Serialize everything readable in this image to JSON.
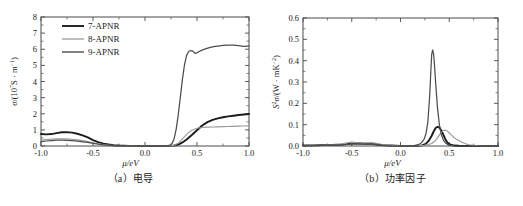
{
  "figure": {
    "panels": [
      {
        "id": "a",
        "caption": "（a）电导",
        "xlabel": "μ/eV",
        "ylabel_html": "σ/(10⁷S · m⁻¹)"
      },
      {
        "id": "b",
        "caption": "（b）功率因子",
        "xlabel": "μ/eV",
        "ylabel_html": "S²σ/(W · mK⁻²)"
      }
    ]
  },
  "colors": {
    "series_7APNR": "#1c1c1c",
    "series_8APNR": "#9a9a9a",
    "series_9APNR": "#4d4d4d",
    "axis": "#4a4a4a",
    "text": "#1a1a1a"
  },
  "legend": {
    "position": "top-left",
    "entries": [
      {
        "label": "7-APNR",
        "color": "#1c1c1c",
        "width": 1.9
      },
      {
        "label": "8-APNR",
        "color": "#9a9a9a",
        "width": 1.3
      },
      {
        "label": "9-APNR",
        "color": "#4d4d4d",
        "width": 1.4
      }
    ]
  },
  "chart_data": [
    {
      "type": "line",
      "panel": "a",
      "title": "（a）电导",
      "xlabel": "μ/eV",
      "ylabel": "σ/(10⁷S · m⁻¹)",
      "xlim": [
        -1.0,
        1.0
      ],
      "ylim": [
        0,
        8
      ],
      "xticks": [
        -1.0,
        -0.5,
        0.0,
        0.5,
        1.0
      ],
      "xticklabels": [
        "-1.0",
        "-0.5",
        "0.0",
        "0.5",
        "1.0"
      ],
      "yticks": [
        0,
        1,
        2,
        3,
        4,
        5,
        6,
        7,
        8
      ],
      "yticklabels": [
        "0",
        "1",
        "2",
        "3",
        "4",
        "5",
        "6",
        "7",
        "8"
      ],
      "grid": false,
      "legend_position": "upper left",
      "series": [
        {
          "name": "7-APNR",
          "color": "#1c1c1c",
          "x": [
            -1.0,
            -0.95,
            -0.9,
            -0.85,
            -0.8,
            -0.75,
            -0.7,
            -0.65,
            -0.6,
            -0.55,
            -0.5,
            -0.45,
            -0.4,
            -0.35,
            -0.3,
            -0.25,
            -0.2,
            -0.15,
            -0.1,
            -0.05,
            0.0,
            0.05,
            0.1,
            0.15,
            0.2,
            0.25,
            0.28,
            0.3,
            0.33,
            0.36,
            0.4,
            0.45,
            0.5,
            0.55,
            0.6,
            0.65,
            0.7,
            0.75,
            0.8,
            0.85,
            0.9,
            0.95,
            1.0
          ],
          "y": [
            0.74,
            0.72,
            0.74,
            0.8,
            0.85,
            0.86,
            0.83,
            0.76,
            0.66,
            0.53,
            0.37,
            0.24,
            0.15,
            0.09,
            0.05,
            0.03,
            0.02,
            0.01,
            0.01,
            0.0,
            0.0,
            0.0,
            0.0,
            0.0,
            0.0,
            0.01,
            0.03,
            0.06,
            0.12,
            0.22,
            0.4,
            0.68,
            0.98,
            1.27,
            1.48,
            1.62,
            1.71,
            1.78,
            1.84,
            1.88,
            1.92,
            1.95,
            1.98
          ]
        },
        {
          "name": "8-APNR",
          "color": "#9a9a9a",
          "x": [
            -1.0,
            -0.95,
            -0.9,
            -0.85,
            -0.8,
            -0.75,
            -0.7,
            -0.65,
            -0.6,
            -0.55,
            -0.5,
            -0.45,
            -0.4,
            -0.35,
            -0.3,
            -0.25,
            -0.2,
            -0.15,
            -0.1,
            -0.05,
            0.0,
            0.05,
            0.1,
            0.15,
            0.2,
            0.25,
            0.28,
            0.3,
            0.33,
            0.36,
            0.4,
            0.45,
            0.5,
            0.55,
            0.6,
            0.65,
            0.7,
            0.75,
            0.8,
            0.85,
            0.9,
            0.95,
            1.0
          ],
          "y": [
            0.36,
            0.4,
            0.43,
            0.45,
            0.45,
            0.44,
            0.42,
            0.38,
            0.33,
            0.27,
            0.2,
            0.14,
            0.09,
            0.06,
            0.04,
            0.02,
            0.01,
            0.01,
            0.0,
            0.0,
            0.0,
            0.0,
            0.0,
            0.0,
            0.0,
            0.01,
            0.04,
            0.1,
            0.24,
            0.44,
            0.72,
            0.98,
            1.1,
            1.15,
            1.17,
            1.18,
            1.19,
            1.2,
            1.21,
            1.22,
            1.23,
            1.24,
            1.25
          ]
        },
        {
          "name": "9-APNR",
          "color": "#4d4d4d",
          "x": [
            -1.0,
            -0.95,
            -0.9,
            -0.85,
            -0.8,
            -0.75,
            -0.7,
            -0.65,
            -0.6,
            -0.55,
            -0.5,
            -0.45,
            -0.4,
            -0.35,
            -0.3,
            -0.25,
            -0.2,
            -0.15,
            -0.1,
            -0.05,
            0.0,
            0.05,
            0.1,
            0.15,
            0.2,
            0.24,
            0.26,
            0.28,
            0.3,
            0.32,
            0.34,
            0.36,
            0.38,
            0.4,
            0.42,
            0.44,
            0.46,
            0.48,
            0.5,
            0.52,
            0.55,
            0.58,
            0.62,
            0.66,
            0.7,
            0.75,
            0.8,
            0.85,
            0.9,
            0.95,
            1.0
          ],
          "y": [
            0.27,
            0.31,
            0.34,
            0.36,
            0.36,
            0.35,
            0.33,
            0.3,
            0.26,
            0.22,
            0.16,
            0.11,
            0.07,
            0.05,
            0.03,
            0.02,
            0.01,
            0.01,
            0.0,
            0.0,
            0.0,
            0.0,
            0.0,
            0.0,
            0.01,
            0.05,
            0.15,
            0.45,
            1.05,
            1.95,
            3.05,
            4.15,
            5.05,
            5.62,
            5.86,
            5.92,
            5.88,
            5.74,
            5.78,
            5.86,
            5.95,
            6.02,
            6.1,
            6.16,
            6.2,
            6.24,
            6.26,
            6.25,
            6.22,
            6.18,
            6.2
          ]
        }
      ]
    },
    {
      "type": "line",
      "panel": "b",
      "title": "（b）功率因子",
      "xlabel": "μ/eV",
      "ylabel": "S²σ/(W · mK⁻²)",
      "xlim": [
        -1.0,
        1.0
      ],
      "ylim": [
        0,
        0.6
      ],
      "xticks": [
        -1.0,
        -0.5,
        0.0,
        0.5,
        1.0
      ],
      "xticklabels": [
        "-1.0",
        "-0.5",
        "0.0",
        "0.5",
        "1.0"
      ],
      "yticks": [
        0.0,
        0.1,
        0.2,
        0.3,
        0.4,
        0.5,
        0.6
      ],
      "yticklabels": [
        "0.0",
        "0.1",
        "0.2",
        "0.3",
        "0.4",
        "0.5",
        "0.6"
      ],
      "grid": false,
      "legend_position": "none",
      "series": [
        {
          "name": "7-APNR",
          "color": "#1c1c1c",
          "x": [
            -1.0,
            -0.9,
            -0.8,
            -0.7,
            -0.6,
            -0.55,
            -0.5,
            -0.45,
            -0.4,
            -0.35,
            -0.3,
            -0.25,
            -0.2,
            -0.15,
            -0.1,
            0.0,
            0.1,
            0.18,
            0.22,
            0.26,
            0.29,
            0.32,
            0.34,
            0.36,
            0.38,
            0.4,
            0.42,
            0.44,
            0.46,
            0.48,
            0.5,
            0.55,
            0.6,
            0.7,
            0.8,
            0.9,
            1.0
          ],
          "y": [
            0.002,
            0.003,
            0.004,
            0.005,
            0.007,
            0.009,
            0.012,
            0.013,
            0.012,
            0.011,
            0.01,
            0.008,
            0.005,
            0.003,
            0.002,
            0.0,
            0.0,
            0.001,
            0.003,
            0.01,
            0.025,
            0.048,
            0.068,
            0.084,
            0.09,
            0.086,
            0.072,
            0.052,
            0.032,
            0.017,
            0.008,
            0.002,
            0.001,
            0.0,
            0.0,
            0.0,
            0.0
          ]
        },
        {
          "name": "8-APNR",
          "color": "#9a9a9a",
          "x": [
            -1.0,
            -0.9,
            -0.8,
            -0.7,
            -0.62,
            -0.56,
            -0.5,
            -0.45,
            -0.4,
            -0.35,
            -0.3,
            -0.25,
            -0.2,
            -0.15,
            -0.1,
            0.0,
            0.1,
            0.18,
            0.24,
            0.28,
            0.32,
            0.36,
            0.38,
            0.4,
            0.42,
            0.44,
            0.46,
            0.48,
            0.5,
            0.52,
            0.55,
            0.58,
            0.62,
            0.66,
            0.7,
            0.8,
            0.9,
            1.0
          ],
          "y": [
            0.001,
            0.002,
            0.003,
            0.005,
            0.008,
            0.014,
            0.018,
            0.016,
            0.013,
            0.014,
            0.016,
            0.013,
            0.008,
            0.004,
            0.002,
            0.0,
            0.0,
            0.001,
            0.003,
            0.006,
            0.012,
            0.026,
            0.038,
            0.052,
            0.065,
            0.073,
            0.074,
            0.07,
            0.062,
            0.052,
            0.04,
            0.03,
            0.02,
            0.012,
            0.006,
            0.001,
            0.0,
            0.0
          ]
        },
        {
          "name": "9-APNR",
          "color": "#4d4d4d",
          "x": [
            -1.0,
            -0.9,
            -0.8,
            -0.7,
            -0.6,
            -0.55,
            -0.5,
            -0.45,
            -0.4,
            -0.35,
            -0.3,
            -0.25,
            -0.2,
            -0.15,
            -0.1,
            0.0,
            0.08,
            0.14,
            0.18,
            0.21,
            0.24,
            0.26,
            0.28,
            0.3,
            0.31,
            0.32,
            0.33,
            0.34,
            0.35,
            0.36,
            0.38,
            0.4,
            0.42,
            0.44,
            0.46,
            0.48,
            0.5,
            0.55,
            0.6,
            0.7,
            0.8,
            0.9,
            1.0
          ],
          "y": [
            0.001,
            0.002,
            0.003,
            0.004,
            0.006,
            0.008,
            0.011,
            0.01,
            0.009,
            0.008,
            0.008,
            0.007,
            0.004,
            0.002,
            0.001,
            0.0,
            0.0,
            0.002,
            0.006,
            0.013,
            0.03,
            0.055,
            0.11,
            0.24,
            0.34,
            0.43,
            0.45,
            0.43,
            0.37,
            0.3,
            0.175,
            0.095,
            0.052,
            0.028,
            0.015,
            0.008,
            0.004,
            0.001,
            0.0,
            0.0,
            0.0,
            0.0,
            0.0
          ]
        }
      ]
    }
  ]
}
